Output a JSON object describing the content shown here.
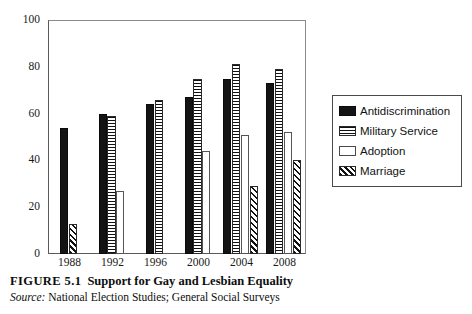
{
  "figure": {
    "number": "FIGURE 5.1",
    "title": "Support for Gay and Lesbian Equality",
    "source_label": "Source:",
    "source_text": "National Election Studies; General Social Surveys"
  },
  "legend": {
    "items": [
      {
        "label": "Antidiscrimination",
        "pattern": "solid-black",
        "color": "#141414"
      },
      {
        "label": "Military Service",
        "pattern": "horizontal-stripes",
        "color": "#111111"
      },
      {
        "label": "Adoption",
        "pattern": "empty-white",
        "color": "#ffffff"
      },
      {
        "label": "Marriage",
        "pattern": "diagonal-hatch",
        "color": "#111111"
      }
    ]
  },
  "chart_data": {
    "type": "bar",
    "title": "Support for Gay and Lesbian Equality",
    "xlabel": "",
    "ylabel": "",
    "ylim": [
      0,
      100
    ],
    "yticks": [
      0,
      20,
      40,
      60,
      80,
      100
    ],
    "grid": false,
    "legend_position": "right",
    "categories": [
      "1988",
      "1992",
      "1996",
      "2000",
      "2004",
      "2008"
    ],
    "series": [
      {
        "name": "Antidiscrimination",
        "values": [
          54,
          60,
          64,
          67,
          75,
          73
        ]
      },
      {
        "name": "Military Service",
        "values": [
          null,
          59,
          66,
          75,
          81,
          79
        ]
      },
      {
        "name": "Adoption",
        "values": [
          null,
          27,
          null,
          44,
          51,
          52
        ]
      },
      {
        "name": "Marriage",
        "values": [
          13,
          null,
          null,
          null,
          29,
          40
        ]
      }
    ]
  }
}
